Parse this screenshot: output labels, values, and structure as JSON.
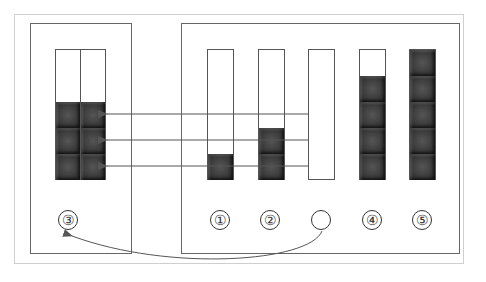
{
  "diagram": {
    "colors": {
      "block": "#3a3a3a",
      "line": "#555555",
      "frame": "#cfcfcf"
    },
    "left_container": {
      "label": "③",
      "rows_filled": 3,
      "columns": 2
    },
    "columns": [
      {
        "label": "①",
        "blocks": 1
      },
      {
        "label": "②",
        "blocks": 2
      },
      {
        "label": "",
        "blocks": 0
      },
      {
        "label": "④",
        "blocks": 4
      },
      {
        "label": "⑤",
        "blocks": 5
      }
    ],
    "arrows": [
      {
        "from": "column-3",
        "to": "left-container",
        "row": 3
      },
      {
        "from": "column-3",
        "to": "left-container",
        "row": 2
      },
      {
        "from": "column-3",
        "to": "left-container",
        "row": 1
      }
    ],
    "curved_arrow": {
      "from": "empty-circle",
      "to": "③"
    }
  }
}
